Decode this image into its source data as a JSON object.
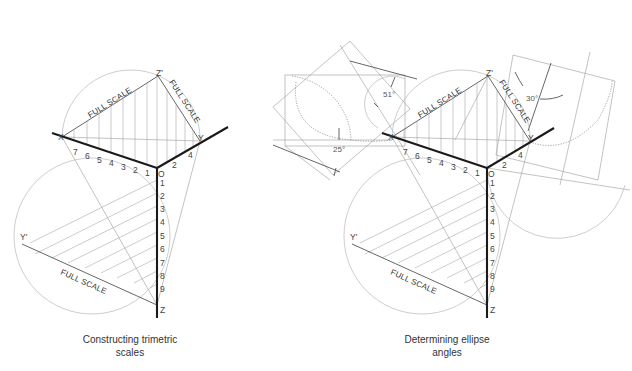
{
  "figures": [
    {
      "id": "left",
      "caption_line1": "Constructing trimetric",
      "caption_line2": "scales",
      "labels": {
        "x": "X",
        "z_prime": "Z'",
        "y": "Y",
        "o": "O",
        "y_prime": "Y'",
        "z": "Z"
      },
      "full_scale_labels": [
        "FULL SCALE",
        "FULL SCALE",
        "FULL SCALE"
      ],
      "x_axis_ticks": [
        "7",
        "6",
        "5",
        "4",
        "3",
        "2",
        "1"
      ],
      "y_axis_ticks": [
        "2",
        "4"
      ],
      "z_axis_ticks": [
        "1",
        "2",
        "3",
        "4",
        "5",
        "6",
        "7",
        "8",
        "9"
      ]
    },
    {
      "id": "right",
      "caption_line1": "Determining ellipse",
      "caption_line2": "angles",
      "labels": {
        "x": "X",
        "z_prime": "Z'",
        "y": "Y",
        "o": "O",
        "y_prime": "Y'",
        "z": "Z"
      },
      "full_scale_labels": [
        "FULL SCALE",
        "FULL SCALE",
        "FULL SCALE"
      ],
      "x_axis_ticks": [
        "7",
        "6",
        "5",
        "4",
        "3",
        "2",
        "1"
      ],
      "y_axis_ticks": [
        "2",
        "4"
      ],
      "z_axis_ticks": [
        "1",
        "2",
        "3",
        "4",
        "5",
        "6",
        "7",
        "8",
        "9"
      ],
      "ellipse_angles": [
        "51°",
        "25°",
        "30°"
      ]
    }
  ]
}
